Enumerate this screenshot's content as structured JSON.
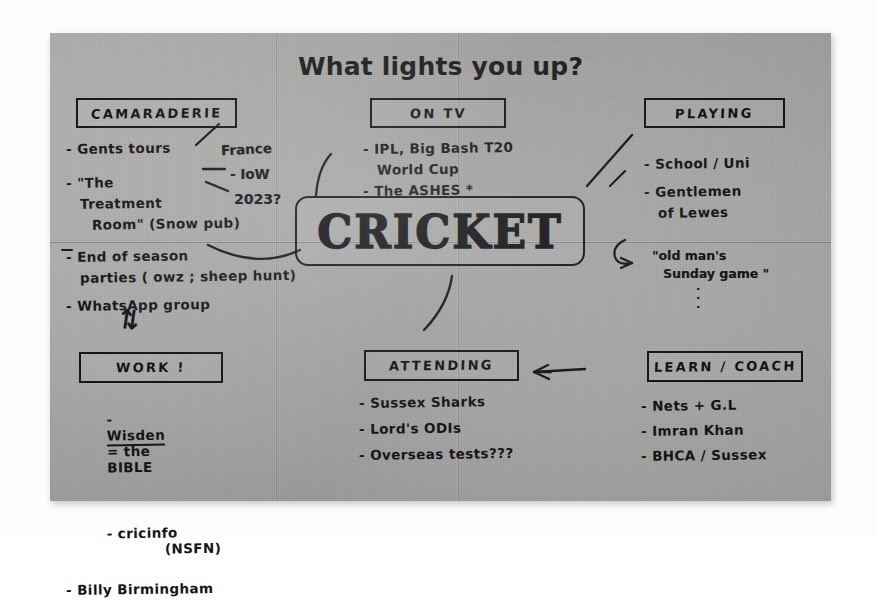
{
  "page": {
    "title": "What lights you up?",
    "medium": "handwritten mind map photographed on grey paper",
    "center_topic": "CRICKET"
  },
  "sections": [
    {
      "id": "camaraderie",
      "heading": "CAMARADERIE",
      "lines": [
        "- Gents tours",
        "France",
        "- IoW",
        "2023?",
        "- \"The",
        "Treatment",
        "Room\" (Snow pub)",
        "- End of season",
        "parties ( owz ; sheep hunt)",
        "- WhatsApp group"
      ],
      "symbol": "⇅"
    },
    {
      "id": "on-tv",
      "heading": "ON   TV",
      "lines": [
        "- IPL, Big Bash T20",
        "World Cup",
        "- The ASHES *"
      ]
    },
    {
      "id": "playing",
      "heading": "PLAYING",
      "lines": [
        "- School / Uni",
        "- Gentlemen",
        "of Lewes"
      ],
      "annotation": "\"old man's\nSunday game \"",
      "annotation_dots": "·\n·\n·"
    },
    {
      "id": "work",
      "heading": "WORK !",
      "lines": [
        "- Wisden = the BIBLE",
        "- cricinfo          (NSFN)",
        "- Billy Birmingham"
      ]
    },
    {
      "id": "attending",
      "heading": "ATTENDING",
      "lines": [
        "- Sussex Sharks",
        "- Lord's ODIs",
        "- Overseas tests???"
      ]
    },
    {
      "id": "learn-coach",
      "heading": "LEARN / COACH",
      "lines": [
        "- Nets + G.L",
        "- Imran Khan",
        "- BHCA / Sussex"
      ]
    }
  ],
  "camaraderie": {
    "heading": "CAMARADERIE",
    "l1": "- Gents tours",
    "branch_france": "France",
    "branch_iow": "- IoW",
    "branch_2023": "2023?",
    "l2": "- \"The",
    "l3": "Treatment",
    "l4": "Room\" (Snow pub)",
    "l5": "- End of season",
    "l6": "parties ( owz ; sheep hunt)",
    "l7": "- WhatsApp group",
    "arrow_symbol": "⇅"
  },
  "on_tv": {
    "heading": "ON   TV",
    "l1": "- IPL, Big Bash T20",
    "l2": "World Cup",
    "l3": "- The ASHES *"
  },
  "playing": {
    "heading": "PLAYING",
    "l1": "- School / Uni",
    "l2": "- Gentlemen",
    "l3": "of Lewes",
    "note1": "\"old man's",
    "note2": "Sunday game \""
  },
  "work": {
    "heading": "WORK !",
    "l1_dash": "-",
    "l1_underlined": "Wisden",
    "l1_rest": "= the",
    "l1_bible": "BIBLE",
    "l2": "- cricinfo",
    "l2_note": "(NSFN)",
    "l3": "- Billy Birmingham"
  },
  "attending": {
    "heading": "ATTENDING",
    "l1": "- Sussex Sharks",
    "l2": "- Lord's ODIs",
    "l3": "- Overseas tests???"
  },
  "learn_coach": {
    "heading": "LEARN / COACH",
    "l1": "- Nets + G.L",
    "l2": "- Imran Khan",
    "l3": "- BHCA / Sussex"
  },
  "colors": {
    "paper": "#a8a8a6",
    "ink": "#15151a",
    "print": "#1d1d1d",
    "backdrop": "#fdfdfd"
  }
}
